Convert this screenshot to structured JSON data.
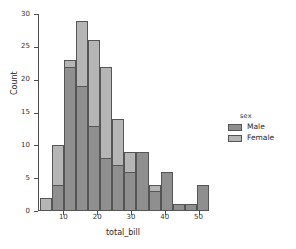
{
  "chart_data": {
    "type": "bar",
    "subtype": "histogram-overlay",
    "title": "",
    "xlabel": "total_bill",
    "ylabel": "Count",
    "xlim": [
      2.5,
      52.5
    ],
    "ylim": [
      0,
      30
    ],
    "grid": false,
    "bin_width": 3.57,
    "x_ticks": [
      10,
      20,
      30,
      40,
      50
    ],
    "y_ticks": [
      0,
      5,
      10,
      15,
      20,
      25,
      30
    ],
    "x_tick_labels": [
      "10",
      "20",
      "30",
      "40",
      "50"
    ],
    "y_tick_labels": [
      "0",
      "5",
      "10",
      "15",
      "20",
      "25",
      "30"
    ],
    "bin_edges": [
      3.07,
      6.64,
      10.21,
      13.78,
      17.35,
      20.92,
      24.49,
      28.06,
      31.63,
      35.2,
      38.77,
      42.34,
      45.91,
      49.48,
      53.05
    ],
    "bin_centers": [
      4.9,
      8.4,
      12.0,
      15.6,
      19.1,
      22.7,
      26.3,
      29.8,
      33.4,
      37.0,
      40.6,
      44.1,
      47.7,
      51.3
    ],
    "series": [
      {
        "name": "Male",
        "color": "#8f8f8f",
        "values": [
          0,
          4,
          22,
          19,
          13,
          8,
          7,
          6,
          9,
          3,
          6,
          1,
          1,
          4
        ]
      },
      {
        "name": "Female",
        "color": "#b5b5b5",
        "values": [
          2,
          10,
          23,
          29,
          26,
          22,
          14,
          9,
          9,
          4,
          0,
          1,
          0,
          0
        ]
      }
    ],
    "legend": {
      "title": "sex",
      "position": "right",
      "entries": [
        {
          "label": "Male",
          "color": "#8f8f8f"
        },
        {
          "label": "Female",
          "color": "#b5b5b5"
        }
      ]
    },
    "colors": {
      "male": "#8f8f8f",
      "female": "#b5b5b5",
      "overlap": "#8a8a8a",
      "edge": "#555555",
      "axis": "#4d4d4d",
      "text": "#262626",
      "background": "#ffffff"
    }
  }
}
